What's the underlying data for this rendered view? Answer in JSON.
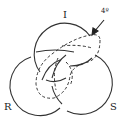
{
  "diagram": {
    "labels": {
      "top": "I",
      "left": "R",
      "right": "S",
      "annotation": "4º"
    },
    "colors": {
      "stroke": "#333333",
      "background": "#ffffff"
    },
    "elements": [
      {
        "id": "circle-I",
        "style": "solid",
        "label": "I"
      },
      {
        "id": "circle-R",
        "style": "solid",
        "label": "R"
      },
      {
        "id": "circle-S",
        "style": "solid",
        "label": "S"
      },
      {
        "id": "loop-4",
        "style": "dashed",
        "label": "4º"
      }
    ]
  }
}
